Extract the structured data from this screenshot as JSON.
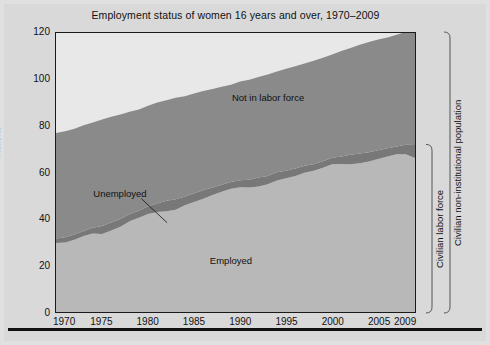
{
  "figure": {
    "title": "Employment status of women 16 years and over, 1970–2009",
    "y_axis_label": "Millions",
    "area_labels": {
      "not_in_labor_force": "Not in labor force",
      "unemployed": "Unemployed",
      "employed": "Employed"
    },
    "brackets": {
      "inner": "Civilian labor force",
      "outer": "Civilian non-institutional population"
    },
    "colors": {
      "employed": "#b8b8b8",
      "unemployed": "#787878",
      "not_in_labor_force": "#8a8a8a",
      "plot_background": "#e8e8e8",
      "page_background": "#d9d9d9",
      "axis": "#1a1a1a",
      "rule": "#111111"
    }
  },
  "chart_data": {
    "type": "area",
    "title": "Employment status of women 16 years and over, 1970–2009",
    "subtitle": "",
    "xlabel": "",
    "ylabel": "Millions",
    "stacked": true,
    "grid": false,
    "legend_position": "in-plot-annotations",
    "xlim": [
      1970,
      2009
    ],
    "ylim": [
      0,
      120
    ],
    "yticks": [
      0,
      20,
      40,
      60,
      80,
      100,
      120
    ],
    "xticks": [
      1970,
      1975,
      1980,
      1985,
      1990,
      1995,
      2000,
      2005,
      2009
    ],
    "x": [
      1970,
      1971,
      1972,
      1973,
      1974,
      1975,
      1976,
      1977,
      1978,
      1979,
      1980,
      1981,
      1982,
      1983,
      1984,
      1985,
      1986,
      1987,
      1988,
      1989,
      1990,
      1991,
      1992,
      1993,
      1994,
      1995,
      1996,
      1997,
      1998,
      1999,
      2000,
      2001,
      2002,
      2003,
      2004,
      2005,
      2006,
      2007,
      2008,
      2009
    ],
    "series": [
      {
        "name": "Employed",
        "color": "#b8b8b8",
        "values": [
          29.7,
          29.9,
          31.1,
          32.7,
          33.8,
          33.6,
          35.1,
          36.7,
          39.0,
          40.5,
          42.1,
          43.0,
          43.3,
          44.0,
          45.9,
          47.3,
          48.7,
          50.3,
          51.7,
          53.0,
          53.7,
          53.5,
          54.0,
          54.9,
          56.6,
          57.5,
          58.5,
          59.9,
          60.8,
          62.0,
          63.6,
          63.7,
          63.6,
          64.0,
          64.7,
          65.8,
          66.9,
          67.8,
          67.9,
          66.2
        ]
      },
      {
        "name": "Unemployed",
        "color": "#787878",
        "values": [
          1.9,
          2.2,
          2.2,
          2.1,
          2.4,
          3.4,
          3.4,
          3.3,
          3.1,
          3.1,
          3.4,
          3.7,
          4.5,
          4.5,
          3.8,
          3.8,
          3.7,
          3.3,
          3.0,
          2.9,
          3.0,
          3.4,
          3.8,
          3.6,
          3.5,
          3.3,
          3.2,
          3.0,
          2.8,
          2.8,
          2.7,
          3.2,
          4.0,
          4.2,
          4.0,
          3.8,
          3.5,
          3.4,
          4.0,
          5.6
        ]
      },
      {
        "name": "Not in labor force",
        "color": "#8a8a8a",
        "values": [
          45.4,
          45.6,
          45.5,
          45.5,
          45.3,
          45.8,
          45.5,
          45.0,
          44.0,
          43.5,
          43.2,
          43.4,
          43.3,
          43.6,
          43.1,
          42.9,
          42.7,
          42.3,
          42.2,
          41.8,
          42.4,
          43.0,
          43.3,
          43.7,
          43.3,
          43.8,
          44.0,
          44.0,
          44.5,
          44.6,
          44.5,
          45.4,
          46.0,
          46.8,
          47.4,
          47.6,
          47.7,
          48.0,
          48.6,
          49.2
        ]
      }
    ],
    "annotations": [
      {
        "text": "Not in labor force",
        "x": 1993,
        "y": 92
      },
      {
        "text": "Unemployed",
        "x": 1977,
        "y": 51,
        "leader_to_x": 1982,
        "leader_to_y": 39
      },
      {
        "text": "Employed",
        "x": 1989,
        "y": 22
      }
    ],
    "brackets": [
      {
        "label": "Civilian labor force",
        "from": 0,
        "to": 72
      },
      {
        "label": "Civilian non-institutional population",
        "from": 0,
        "to": 120
      }
    ]
  }
}
